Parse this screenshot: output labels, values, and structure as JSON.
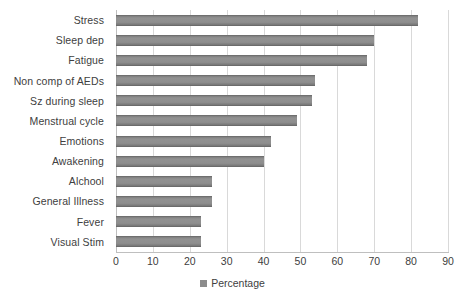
{
  "chart_data": {
    "type": "bar",
    "orientation": "horizontal",
    "title": "",
    "xlabel": "",
    "ylabel": "",
    "xlim": [
      0,
      90
    ],
    "xticks": [
      0,
      10,
      20,
      30,
      40,
      50,
      60,
      70,
      80,
      90
    ],
    "grid": true,
    "legend_position": "bottom",
    "categories": [
      "Visual Stim",
      "Fever",
      "General Illness",
      "Alchool",
      "Awakening",
      "Emotions",
      "Menstrual cycle",
      "Sz during sleep",
      "Non comp of AEDs",
      "Fatigue",
      "Sleep dep",
      "Stress"
    ],
    "series": [
      {
        "name": "Percentage",
        "color": "#8c8c8c",
        "values": [
          23,
          23,
          26,
          26,
          40,
          42,
          49,
          53,
          54,
          68,
          70,
          82
        ]
      }
    ]
  },
  "legend": {
    "entries": [
      {
        "label": "Percentage",
        "color": "#8c8c8c"
      }
    ]
  }
}
